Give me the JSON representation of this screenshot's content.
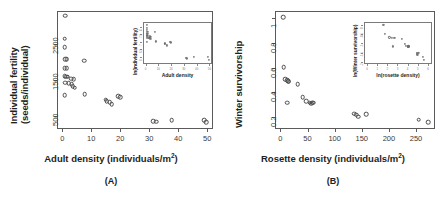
{
  "figure": {
    "panels": [
      {
        "tag": "(A)",
        "ylabel_line1": "Individual fertility",
        "ylabel_line2": "(seeds/individual)",
        "xlabel_text": "Adult density (individuals/m",
        "xlabel_sup": "2",
        "xlabel_tail": ")",
        "chart_data": {
          "type": "scatter",
          "title": "",
          "xlabel": "Adult density (individuals/m2)",
          "ylabel": "Individual fertility (seeds/individual)",
          "xlim": [
            -1.8,
            52
          ],
          "ylim": [
            150,
            3400
          ],
          "xticks": [
            0,
            10,
            20,
            30,
            40,
            50
          ],
          "yticks": [
            500,
            1500,
            2500
          ],
          "grid": false,
          "legend": null,
          "marker": "open-circle",
          "points": [
            {
              "x": 1.0,
              "y": 3270
            },
            {
              "x": 0.9,
              "y": 2640
            },
            {
              "x": 0.9,
              "y": 2400
            },
            {
              "x": 1.0,
              "y": 2080
            },
            {
              "x": 1.6,
              "y": 2070
            },
            {
              "x": 7.6,
              "y": 2030
            },
            {
              "x": 0.9,
              "y": 1830
            },
            {
              "x": 1.5,
              "y": 1820
            },
            {
              "x": 0.8,
              "y": 1600
            },
            {
              "x": 1.3,
              "y": 1590
            },
            {
              "x": 1.9,
              "y": 1585
            },
            {
              "x": 3.2,
              "y": 1540
            },
            {
              "x": 4.0,
              "y": 1520
            },
            {
              "x": 1.0,
              "y": 1420
            },
            {
              "x": 2.2,
              "y": 1415
            },
            {
              "x": 3.3,
              "y": 1390
            },
            {
              "x": 3.6,
              "y": 1330
            },
            {
              "x": 4.3,
              "y": 1290
            },
            {
              "x": 7.8,
              "y": 1110
            },
            {
              "x": 0.9,
              "y": 1080
            },
            {
              "x": 19.3,
              "y": 1060
            },
            {
              "x": 20.0,
              "y": 1030
            },
            {
              "x": 15.0,
              "y": 960
            },
            {
              "x": 15.3,
              "y": 920
            },
            {
              "x": 16.4,
              "y": 880
            },
            {
              "x": 17.0,
              "y": 840
            },
            {
              "x": 31.4,
              "y": 360
            },
            {
              "x": 32.4,
              "y": 355
            },
            {
              "x": 37.8,
              "y": 400
            },
            {
              "x": 48.9,
              "y": 390
            },
            {
              "x": 49.6,
              "y": 330
            }
          ]
        },
        "inset": {
          "ylabel": "ln(individual fertility)",
          "xlabel": "Adult density",
          "chart_data": {
            "type": "scatter",
            "xlabel": "Adult density",
            "ylabel": "ln(individual fertility)",
            "xlim": [
              -2,
              52
            ],
            "ylim": [
              5.5,
              8.3
            ],
            "xticks": [
              0,
              10,
              20,
              30,
              40,
              50
            ],
            "yticks": [
              6.0,
              6.5,
              7.0,
              7.5,
              8.0
            ],
            "grid": false,
            "marker": "open-circle",
            "points": [
              {
                "x": 1.0,
                "y": 8.09
              },
              {
                "x": 0.9,
                "y": 7.88
              },
              {
                "x": 0.9,
                "y": 7.78
              },
              {
                "x": 1.0,
                "y": 7.64
              },
              {
                "x": 1.6,
                "y": 7.64
              },
              {
                "x": 7.6,
                "y": 7.62
              },
              {
                "x": 0.9,
                "y": 7.51
              },
              {
                "x": 1.5,
                "y": 7.51
              },
              {
                "x": 0.8,
                "y": 7.38
              },
              {
                "x": 1.3,
                "y": 7.37
              },
              {
                "x": 1.9,
                "y": 7.37
              },
              {
                "x": 3.2,
                "y": 7.34
              },
              {
                "x": 4.0,
                "y": 7.33
              },
              {
                "x": 1.0,
                "y": 7.26
              },
              {
                "x": 2.2,
                "y": 7.25
              },
              {
                "x": 3.3,
                "y": 7.24
              },
              {
                "x": 3.6,
                "y": 7.19
              },
              {
                "x": 4.3,
                "y": 7.16
              },
              {
                "x": 7.8,
                "y": 7.01
              },
              {
                "x": 0.9,
                "y": 6.98
              },
              {
                "x": 19.3,
                "y": 6.97
              },
              {
                "x": 20.0,
                "y": 6.94
              },
              {
                "x": 15.0,
                "y": 6.87
              },
              {
                "x": 15.3,
                "y": 6.82
              },
              {
                "x": 16.4,
                "y": 6.78
              },
              {
                "x": 17.0,
                "y": 6.73
              },
              {
                "x": 31.4,
                "y": 5.89
              },
              {
                "x": 32.4,
                "y": 5.87
              },
              {
                "x": 37.8,
                "y": 5.99
              },
              {
                "x": 48.9,
                "y": 5.97
              },
              {
                "x": 49.6,
                "y": 5.8
              }
            ]
          }
        }
      },
      {
        "tag": "(B)",
        "ylabel_line1": "Winter survivorship",
        "ylabel_line2": "",
        "xlabel_text": "Rosette density  (individuals/m",
        "xlabel_sup": "2",
        "xlabel_tail": ")",
        "chart_data": {
          "type": "scatter",
          "title": "",
          "xlabel": "Rosette density (individuals/m2)",
          "ylabel": "Winter survivorship",
          "xlim": [
            -10,
            285
          ],
          "ylim": [
            0.1,
            1.06
          ],
          "xticks": [
            0,
            50,
            100,
            150,
            200,
            250
          ],
          "yticks": [
            0.2,
            0.4,
            0.6,
            0.8,
            1.0
          ],
          "grid": false,
          "legend": null,
          "marker": "open-circle",
          "points": [
            {
              "x": 5,
              "y": 1.01
            },
            {
              "x": 6,
              "y": 0.605
            },
            {
              "x": 9,
              "y": 0.505
            },
            {
              "x": 12,
              "y": 0.495
            },
            {
              "x": 14,
              "y": 0.49
            },
            {
              "x": 15,
              "y": 0.485
            },
            {
              "x": 13,
              "y": 0.315
            },
            {
              "x": 32,
              "y": 0.465
            },
            {
              "x": 41,
              "y": 0.36
            },
            {
              "x": 47,
              "y": 0.325
            },
            {
              "x": 54,
              "y": 0.315
            },
            {
              "x": 57,
              "y": 0.305
            },
            {
              "x": 59,
              "y": 0.315
            },
            {
              "x": 60,
              "y": 0.315
            },
            {
              "x": 136,
              "y": 0.225
            },
            {
              "x": 140,
              "y": 0.215
            },
            {
              "x": 143,
              "y": 0.2
            },
            {
              "x": 158,
              "y": 0.22
            },
            {
              "x": 255,
              "y": 0.175
            },
            {
              "x": 272,
              "y": 0.155
            }
          ]
        },
        "inset": {
          "ylabel": "ln(Winter survivorship)",
          "xlabel": "ln(rosette density)",
          "chart_data": {
            "type": "scatter",
            "xlabel": "ln(rosette density)",
            "ylabel": "ln(Winter survivorship)",
            "xlim": [
              -0.3,
              6.4
            ],
            "ylim": [
              -2.1,
              0.15
            ],
            "xticks": [
              0,
              1,
              2,
              3,
              4,
              5,
              6
            ],
            "yticks": [
              -2.0,
              -1.5,
              -1.0,
              -0.5,
              0.0
            ],
            "grid": false,
            "marker": "open-circle",
            "points": [
              {
                "x": 1.61,
                "y": 0.01
              },
              {
                "x": 1.79,
                "y": -0.5
              },
              {
                "x": 2.2,
                "y": -0.68
              },
              {
                "x": 2.48,
                "y": -0.7
              },
              {
                "x": 2.64,
                "y": -0.71
              },
              {
                "x": 2.71,
                "y": -0.72
              },
              {
                "x": 2.56,
                "y": -1.16
              },
              {
                "x": 3.47,
                "y": -0.77
              },
              {
                "x": 3.71,
                "y": -1.02
              },
              {
                "x": 3.85,
                "y": -1.12
              },
              {
                "x": 3.99,
                "y": -1.16
              },
              {
                "x": 4.04,
                "y": -1.19
              },
              {
                "x": 4.08,
                "y": -1.16
              },
              {
                "x": 4.09,
                "y": -1.16
              },
              {
                "x": 4.91,
                "y": -1.49
              },
              {
                "x": 4.94,
                "y": -1.54
              },
              {
                "x": 4.96,
                "y": -1.61
              },
              {
                "x": 5.06,
                "y": -1.51
              },
              {
                "x": 5.54,
                "y": -1.74
              },
              {
                "x": 5.61,
                "y": -1.86
              }
            ]
          }
        }
      }
    ]
  }
}
